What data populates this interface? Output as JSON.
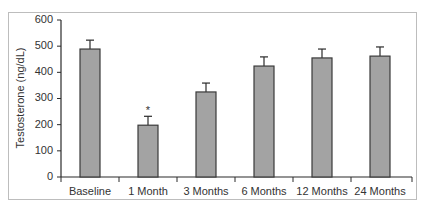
{
  "chart_data": {
    "type": "bar",
    "title": "",
    "xlabel": "",
    "ylabel": "Testosterone (ng/dL)",
    "ylim": [
      0,
      600
    ],
    "yticks": [
      0,
      100,
      200,
      300,
      400,
      500,
      600
    ],
    "grid": false,
    "legend": null,
    "categories": [
      "Baseline",
      "1 Month",
      "3 Months",
      "6 Months",
      "12 Months",
      "24 Months"
    ],
    "values": [
      489,
      198,
      325,
      424,
      455,
      462
    ],
    "error_upper": [
      34,
      34,
      34,
      35,
      34,
      35
    ],
    "annotations": [
      {
        "category": "1 Month",
        "text": "*"
      }
    ],
    "colors": {
      "bar_fill": "#a3a3a3",
      "bar_stroke": "#3a3a3a",
      "axis": "#2a2a2a",
      "frame": "#bdbdbd"
    }
  }
}
